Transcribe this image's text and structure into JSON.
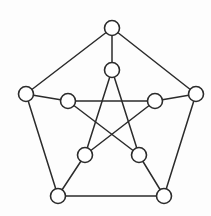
{
  "figure": {
    "background_color": "#fdfdfd",
    "stroke_color": "#2b2b2b",
    "vertex_fill_color": "#ffffff",
    "vertex_radius": 7.5,
    "edge_width": 1.5,
    "width": 211,
    "height": 216
  },
  "chart_data": {
    "type": "diagram",
    "diagram_kind": "undirected-graph",
    "vertex_count": 10,
    "edge_count": 15,
    "nodes": [
      {
        "id": "o0",
        "label": "",
        "group": "outer",
        "x": 112,
        "y": 28
      },
      {
        "id": "o1",
        "label": "",
        "group": "outer",
        "x": 196,
        "y": 94
      },
      {
        "id": "o2",
        "label": "",
        "group": "outer",
        "x": 164,
        "y": 196
      },
      {
        "id": "o3",
        "label": "",
        "group": "outer",
        "x": 58,
        "y": 196
      },
      {
        "id": "o4",
        "label": "",
        "group": "outer",
        "x": 26,
        "y": 94
      },
      {
        "id": "i0",
        "label": "",
        "group": "inner",
        "x": 112,
        "y": 70
      },
      {
        "id": "i1",
        "label": "",
        "group": "inner",
        "x": 155,
        "y": 101
      },
      {
        "id": "i2",
        "label": "",
        "group": "inner",
        "x": 139,
        "y": 155
      },
      {
        "id": "i3",
        "label": "",
        "group": "inner",
        "x": 85,
        "y": 155
      },
      {
        "id": "i4",
        "label": "",
        "group": "inner",
        "x": 68,
        "y": 101
      }
    ],
    "edges": [
      {
        "from": "o0",
        "to": "o1",
        "kind": "outer-cycle"
      },
      {
        "from": "o1",
        "to": "o2",
        "kind": "outer-cycle"
      },
      {
        "from": "o2",
        "to": "o3",
        "kind": "outer-cycle"
      },
      {
        "from": "o3",
        "to": "o4",
        "kind": "outer-cycle"
      },
      {
        "from": "o4",
        "to": "o0",
        "kind": "outer-cycle"
      },
      {
        "from": "o0",
        "to": "i0",
        "kind": "spoke"
      },
      {
        "from": "o1",
        "to": "i1",
        "kind": "spoke"
      },
      {
        "from": "o2",
        "to": "i2",
        "kind": "spoke"
      },
      {
        "from": "o3",
        "to": "i3",
        "kind": "spoke"
      },
      {
        "from": "o4",
        "to": "i4",
        "kind": "spoke"
      },
      {
        "from": "i0",
        "to": "i2",
        "kind": "inner-pentagram"
      },
      {
        "from": "i2",
        "to": "i4",
        "kind": "inner-pentagram"
      },
      {
        "from": "i4",
        "to": "i1",
        "kind": "inner-pentagram"
      },
      {
        "from": "i1",
        "to": "i3",
        "kind": "inner-pentagram"
      },
      {
        "from": "i3",
        "to": "i0",
        "kind": "inner-pentagram"
      }
    ],
    "legend": [],
    "annotations": []
  }
}
